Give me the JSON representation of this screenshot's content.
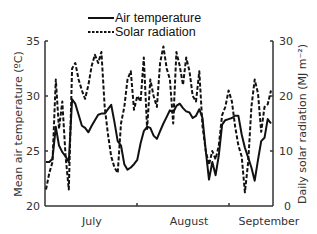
{
  "chart_data": {
    "type": "line",
    "title": "",
    "xlabel": "",
    "ylabel": "Mean air temperature (ºC)",
    "ylabel_right": "Daily solar radiation (MJ m⁻²)",
    "ylim": [
      20,
      35
    ],
    "ylim_right": [
      0,
      30
    ],
    "yticks": [
      "20",
      "25",
      "30",
      "35"
    ],
    "yticks_right": [
      "0",
      "10",
      "20",
      "30"
    ],
    "x_tick_labels": [
      "July",
      "August",
      "September"
    ],
    "grid": false,
    "legend_position": "top-center",
    "legend": [
      "Air temperature",
      "Solar radiation"
    ],
    "x": [
      1,
      2,
      3,
      4,
      5,
      6,
      7,
      8,
      9,
      10,
      11,
      12,
      13,
      14,
      15,
      16,
      17,
      18,
      19,
      20,
      21,
      22,
      23,
      24,
      25,
      26,
      27,
      28,
      29,
      30,
      31,
      32,
      33,
      34,
      35,
      36,
      37,
      38,
      39,
      40,
      41,
      42,
      43,
      44,
      45,
      46,
      47,
      48,
      49,
      50,
      51,
      52,
      53,
      54,
      55,
      56,
      57,
      58,
      59,
      60,
      61,
      62,
      63,
      64,
      65,
      66,
      67,
      68,
      69,
      70
    ],
    "series": [
      {
        "name": "Air temperature",
        "axis": "left",
        "style": "solid",
        "values": [
          24.0,
          24.0,
          24.3,
          27.2,
          25.5,
          24.9,
          24.5,
          24.0,
          29.7,
          29.3,
          28.3,
          27.3,
          27.1,
          26.7,
          27.3,
          27.8,
          28.3,
          28.4,
          28.4,
          28.8,
          29.2,
          27.6,
          25.9,
          25.5,
          23.8,
          23.3,
          23.5,
          23.8,
          24.2,
          25.7,
          26.8,
          27.2,
          27.1,
          26.4,
          26.1,
          26.8,
          27.5,
          28.1,
          28.7,
          28.5,
          29.1,
          29.3,
          28.9,
          28.6,
          28.5,
          28.0,
          28.2,
          28.8,
          28.0,
          25.0,
          22.4,
          24.0,
          22.8,
          24.6,
          27.4,
          27.8,
          27.9,
          28.0,
          28.2,
          28.2,
          26.5,
          25.3,
          24.4,
          23.5,
          22.3,
          24.2,
          25.9,
          26.2,
          27.9,
          27.5
        ]
      },
      {
        "name": "Solar radiation",
        "axis": "right",
        "style": "dashed",
        "values": [
          3.0,
          6.0,
          8.0,
          23.0,
          14.0,
          19.0,
          9.0,
          3.0,
          25.0,
          26.0,
          23.0,
          21.0,
          19.5,
          22.0,
          25.5,
          27.5,
          26.0,
          28.0,
          18.0,
          13.0,
          9.0,
          7.0,
          6.0,
          15.0,
          18.0,
          23.0,
          24.5,
          17.5,
          20.0,
          19.0,
          27.0,
          14.0,
          23.0,
          20.0,
          18.0,
          26.0,
          29.0,
          25.0,
          23.0,
          15.0,
          28.0,
          25.5,
          22.0,
          27.0,
          24.5,
          20.0,
          19.0,
          24.5,
          14.5,
          10.0,
          7.5,
          10.0,
          8.5,
          11.0,
          16.5,
          18.0,
          21.0,
          19.0,
          14.5,
          11.0,
          9.0,
          2.5,
          8.0,
          18.0,
          23.0,
          20.5,
          13.5,
          18.0,
          18.5,
          21.0
        ]
      }
    ]
  },
  "legend": {
    "air_temperature": "Air temperature",
    "solar_radiation": "Solar radiation"
  },
  "axes": {
    "left_label": "Mean air temperature (ºC)",
    "right_label": "Daily solar radiation (MJ m⁻²)",
    "left_ticks": [
      "35",
      "30",
      "25",
      "20"
    ],
    "right_ticks": [
      "30",
      "20",
      "10",
      "0"
    ],
    "x_ticks": [
      "July",
      "August",
      "September"
    ]
  }
}
